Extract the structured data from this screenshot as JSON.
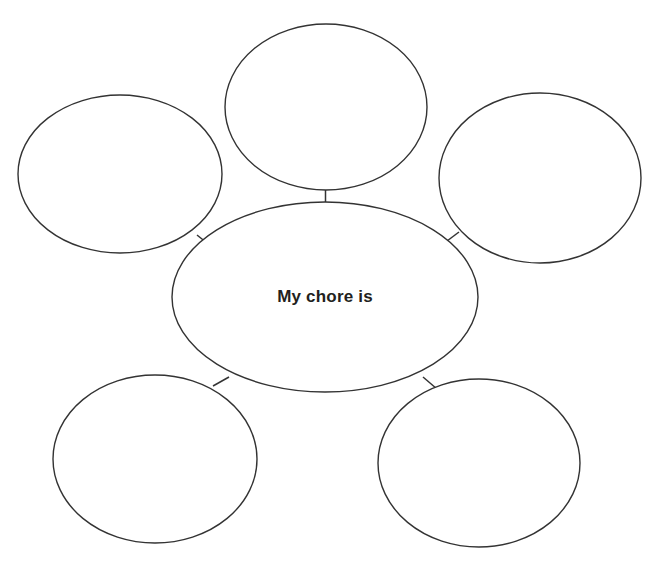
{
  "page": {
    "title": "My chore is",
    "type": "bubble-map-graphic-organizer",
    "background_color": "#ffffff",
    "stroke_color": "#333333",
    "text_color": "#231f20",
    "width": 656,
    "height": 562
  },
  "center": {
    "label": "My chore is",
    "cx": 325,
    "cy": 297,
    "rx": 153,
    "ry": 95
  },
  "branches": [
    {
      "id": "top",
      "label": "",
      "cx": 326,
      "cy": 107,
      "rx": 101,
      "ry": 83,
      "connector": {
        "x1": 325.5,
        "y1": 190,
        "x2": 325.5,
        "y2": 205
      }
    },
    {
      "id": "upper-left",
      "label": "",
      "cx": 120,
      "cy": 174,
      "rx": 102,
      "ry": 79,
      "connector": {
        "x1": 197,
        "y1": 235,
        "x2": 212,
        "y2": 247
      }
    },
    {
      "id": "upper-right",
      "label": "",
      "cx": 540,
      "cy": 178,
      "rx": 101,
      "ry": 85,
      "connector": {
        "x1": 459,
        "y1": 232,
        "x2": 443,
        "y2": 244
      }
    },
    {
      "id": "lower-left",
      "label": "",
      "cx": 155,
      "cy": 459,
      "rx": 102,
      "ry": 84,
      "connector": {
        "x1": 213,
        "y1": 386,
        "x2": 229,
        "y2": 377
      }
    },
    {
      "id": "lower-right",
      "label": "",
      "cx": 479,
      "cy": 463,
      "rx": 101,
      "ry": 84,
      "connector": {
        "x1": 423,
        "y1": 377,
        "x2": 437,
        "y2": 389
      }
    }
  ]
}
